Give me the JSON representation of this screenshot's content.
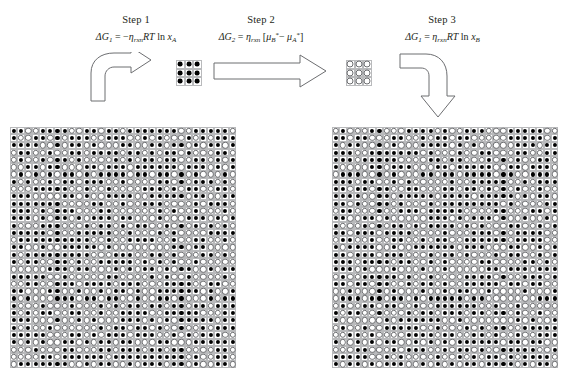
{
  "figure": {
    "type": "thermodynamic-cycle-lattice-diagram",
    "background_color": "#ffffff",
    "ink_color": "#231f20",
    "grid_line_color": "#b9babc",
    "filled_site_color": "#000000",
    "open_site_color": "#ffffff",
    "open_site_outline_color": "#6d6e71",
    "arrow_stroke_color": "#6d6e71",
    "arrow_fill_color": "#ffffff"
  },
  "steps": [
    {
      "id": "step1",
      "title": "Step 1",
      "equation_plain": "ΔG1 = -ηrxn RT ln xA",
      "equation_parts": {
        "lhs": "ΔG",
        "lhs_sub": "1",
        "eq": " = −",
        "eta": "η",
        "eta_sub": "rxn",
        "RT": "RT",
        "ln": " ln ",
        "x": "x",
        "x_sub": "A"
      }
    },
    {
      "id": "step2",
      "title": "Step 2",
      "equation_plain": "ΔG2 = ηrxn [μB* − μA*]",
      "equation_parts": {
        "lhs": "ΔG",
        "lhs_sub": "2",
        "eq": " = ",
        "eta": "η",
        "eta_sub": "rxn",
        "bracket_open": " [",
        "mu1": "μ",
        "mu1_sub": "B",
        "mu1_sup": "*",
        "minus": " − ",
        "mu2": "μ",
        "mu2_sub": "A",
        "mu2_sup": "*",
        "bracket_close": "]"
      }
    },
    {
      "id": "step3",
      "title": "Step 3",
      "equation_plain": "ΔG1 = ηrxn RT ln xB",
      "equation_parts": {
        "lhs": "ΔG",
        "lhs_sub": "1",
        "eq": " = ",
        "eta": "η",
        "eta_sub": "rxn",
        "RT": "RT",
        "ln": " ln ",
        "x": "x",
        "x_sub": "B"
      }
    }
  ],
  "arrows": [
    {
      "id": "arrow1",
      "shape": "curved-up-right",
      "label": ""
    },
    {
      "id": "arrow2",
      "shape": "straight-right",
      "label": ""
    },
    {
      "id": "arrow3",
      "shape": "curved-right-down",
      "label": ""
    }
  ],
  "lattices": {
    "left_mixture": {
      "name": "left-lattice",
      "rows": 33,
      "cols": 31,
      "cell_px": 7.3,
      "description": "Large binary lattice of mixed filled (A) and open (B) sites",
      "fill_fraction": 0.55,
      "pattern_seed": 20117
    },
    "right_mixture": {
      "name": "right-lattice",
      "rows": 33,
      "cols": 31,
      "cell_px": 7.3,
      "description": "Large binary lattice of mixed filled (A) and open (B) sites",
      "fill_fraction": 0.55,
      "pattern_seed": 74313
    },
    "small_pure_a": {
      "name": "small-lattice-pure-a",
      "rows": 3,
      "cols": 3,
      "cell_px": 8.5,
      "description": "3x3 lattice, all sites filled (pure A)",
      "all_filled": true
    },
    "small_pure_b": {
      "name": "small-lattice-pure-b",
      "rows": 3,
      "cols": 3,
      "cell_px": 8.5,
      "description": "3x3 lattice, all sites open (pure B)",
      "all_filled": false
    }
  }
}
